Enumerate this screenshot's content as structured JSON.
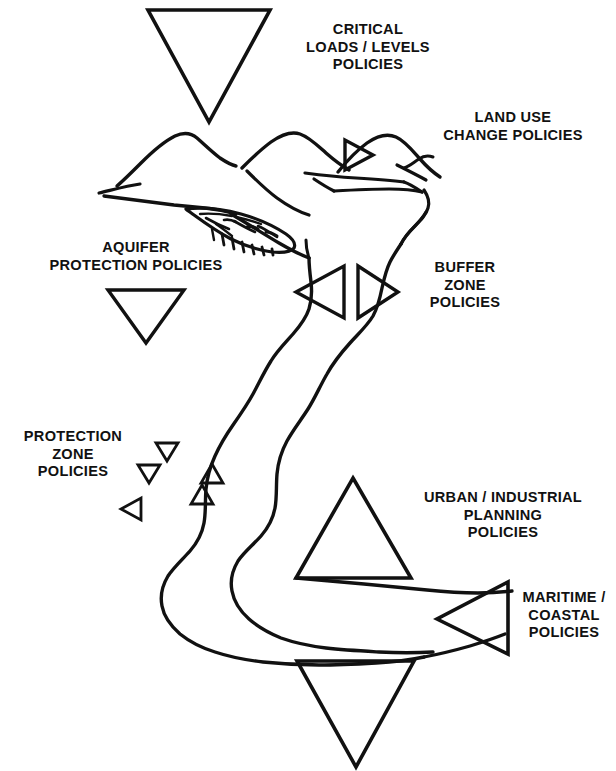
{
  "figure": {
    "background_color": "#ffffff",
    "ink_color": "#111111",
    "style": "hand-drawn black line art, no fill"
  },
  "labels": {
    "critical_loads": {
      "lines": [
        "CRITICAL",
        "LOADS / LEVELS",
        "POLICIES"
      ],
      "text": "CRITICAL\nLOADS / LEVELS\nPOLICIES"
    },
    "land_use_change": {
      "lines": [
        "LAND USE",
        "CHANGE POLICIES"
      ],
      "text": "LAND USE\nCHANGE POLICIES"
    },
    "aquifer_protection": {
      "lines": [
        "AQUIFER",
        "PROTECTION POLICIES"
      ],
      "text": "AQUIFER\nPROTECTION POLICIES"
    },
    "buffer_zone": {
      "lines": [
        "BUFFER",
        "ZONE",
        "POLICIES"
      ],
      "text": "BUFFER\nZONE\nPOLICIES"
    },
    "protection_zone": {
      "lines": [
        "PROTECTION",
        "ZONE",
        "POLICIES"
      ],
      "text": "PROTECTION\nZONE\nPOLICIES"
    },
    "urban_industrial": {
      "lines": [
        "URBAN / INDUSTRIAL",
        "PLANNING",
        "POLICIES"
      ],
      "text": "URBAN / INDUSTRIAL\nPLANNING\nPOLICIES"
    },
    "maritime_coastal": {
      "lines": [
        "MARITIME /",
        "COASTAL",
        "POLICIES"
      ],
      "text": "MARITIME /\nCOASTAL\nPOLICIES"
    }
  },
  "markers": [
    {
      "id": "critical-loads-marker",
      "shape": "triangle-down",
      "size": "large",
      "label": "CRITICAL LOADS / LEVELS POLICIES"
    },
    {
      "id": "land-use-marker",
      "shape": "triangle-right",
      "size": "small",
      "label": "LAND USE CHANGE POLICIES"
    },
    {
      "id": "aquifer-marker",
      "shape": "triangle-down",
      "size": "medium",
      "label": "AQUIFER PROTECTION POLICIES"
    },
    {
      "id": "buffer-zone-marker-left",
      "shape": "triangle-left",
      "size": "medium",
      "label": "BUFFER ZONE POLICIES"
    },
    {
      "id": "buffer-zone-marker-right",
      "shape": "triangle-right",
      "size": "medium",
      "label": "BUFFER ZONE POLICIES"
    },
    {
      "id": "protection-zone-marker-1",
      "shape": "triangle-down",
      "size": "tiny",
      "label": "PROTECTION ZONE POLICIES"
    },
    {
      "id": "protection-zone-marker-2",
      "shape": "triangle-down",
      "size": "tiny",
      "label": "PROTECTION ZONE POLICIES"
    },
    {
      "id": "protection-zone-marker-3",
      "shape": "triangle-left",
      "size": "tiny",
      "label": "PROTECTION ZONE POLICIES"
    },
    {
      "id": "protection-zone-marker-4",
      "shape": "triangle-up",
      "size": "tiny",
      "label": "PROTECTION ZONE POLICIES"
    },
    {
      "id": "protection-zone-marker-5",
      "shape": "triangle-up",
      "size": "tiny",
      "label": "PROTECTION ZONE POLICIES"
    },
    {
      "id": "urban-industrial-marker",
      "shape": "triangle-up",
      "size": "large",
      "label": "URBAN / INDUSTRIAL PLANNING POLICIES"
    },
    {
      "id": "maritime-coastal-marker",
      "shape": "triangle-left",
      "size": "large",
      "label": "MARITIME / COASTAL POLICIES"
    },
    {
      "id": "estuary-marker",
      "shape": "triangle-down",
      "size": "large",
      "label": ""
    }
  ],
  "features": [
    {
      "id": "mountain-ridges",
      "name": "mountain / hill ridge lines",
      "count": 3
    },
    {
      "id": "aquifer-body",
      "name": "hatched aquifer lens"
    },
    {
      "id": "river",
      "name": "river drawn as two parallel bank lines, source in mountains to estuary"
    },
    {
      "id": "coastline",
      "name": "coastline / estuary shore lines"
    }
  ]
}
